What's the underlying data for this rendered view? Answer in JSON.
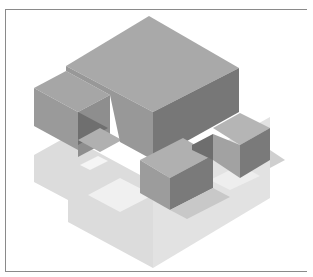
{
  "figure": {
    "colors": {
      "top_dark": "#a9a9a9",
      "side_dark": "#7a7a7a",
      "front_mid": "#959595",
      "top_light": "#c4c4c4",
      "side_light": "#b3b3b3",
      "pale": "#dcdcdc",
      "paler": "#ebebeb",
      "shadow": "#d0d0d0",
      "frame": "#8a8a8a"
    }
  }
}
